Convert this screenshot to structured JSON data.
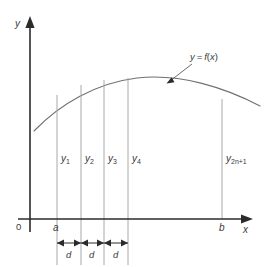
{
  "figure": {
    "axes": {
      "y_label": "y",
      "x_label": "x",
      "origin_label": "0",
      "lower_limit_label": "a",
      "upper_limit_label": "b"
    },
    "curve_label": {
      "text": "y = f(x)",
      "lhs": "y",
      "equals": "=",
      "fn": "f",
      "open": "(",
      "var": "x",
      "close": ")"
    },
    "ordinates": [
      {
        "id": "y1",
        "base": "y",
        "sub": "1",
        "label": "y₁",
        "x": 57,
        "top_y": 95
      },
      {
        "id": "y2",
        "base": "y",
        "sub": "2",
        "label": "y₂",
        "x": 81,
        "top_y": 85
      },
      {
        "id": "y3",
        "base": "y",
        "sub": "3",
        "label": "y₃",
        "x": 104,
        "top_y": 80
      },
      {
        "id": "y4",
        "base": "y",
        "sub": "4",
        "label": "y₄",
        "x": 128,
        "top_y": 78
      },
      {
        "id": "y2n1",
        "base": "y",
        "sub": "2n+1",
        "label": "y₂ₙ₊₁",
        "x": 222,
        "top_y": 99
      }
    ],
    "spacings": [
      {
        "label": "d",
        "from": 57,
        "to": 81
      },
      {
        "label": "d",
        "from": 81,
        "to": 104
      },
      {
        "label": "d",
        "from": 104,
        "to": 128
      }
    ],
    "colors": {
      "axis": "#2b2b2b",
      "curve": "#707070",
      "ordinate": "#a8a8a8",
      "dimension": "#2b2b2b",
      "background": "#ffffff",
      "text": "#3a3a3a"
    },
    "geometry": {
      "y_axis_x": 30,
      "x_axis_y": 219,
      "y_axis_top": 18,
      "x_axis_right": 252,
      "curve_start": [
        34,
        131
      ],
      "curve_peak": [
        137,
        78
      ],
      "curve_end": [
        260,
        106
      ],
      "dim_row_y": 243,
      "ext_bottom_y": 265
    }
  }
}
